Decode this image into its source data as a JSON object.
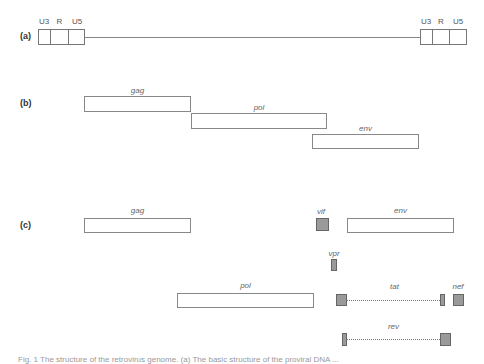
{
  "panels": {
    "a": {
      "label": "(a)",
      "ltr_left": {
        "segments": [
          "U3",
          "R",
          "U5"
        ]
      },
      "ltr_right": {
        "segments": [
          "U3",
          "R",
          "U5"
        ]
      }
    },
    "b": {
      "label": "(b)",
      "genes": [
        "gag",
        "pol",
        "env"
      ]
    },
    "c": {
      "label": "(c)",
      "genes": {
        "gag": "gag",
        "vif": "vif",
        "env": "env",
        "vpr": "vpr",
        "pol": "pol",
        "tat": "tat",
        "nef": "nef",
        "rev": "rev"
      }
    }
  },
  "caption": "Fig. 1 The structure of the retrovirus genome. (a) The basic structure of the proviral DNA ..."
}
